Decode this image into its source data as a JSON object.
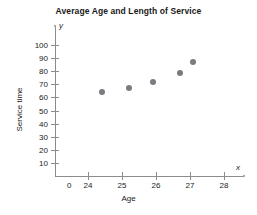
{
  "chart_data": {
    "type": "scatter",
    "title": "Average Age and Length of Service",
    "xlabel": "Age",
    "ylabel": "Service time",
    "xlim": [
      23.5,
      28.5
    ],
    "ylim": [
      0,
      105
    ],
    "grid": false,
    "legend": null,
    "x_axis_symbol": "x",
    "y_axis_symbol": "y",
    "xticks": [
      {
        "label": "0",
        "value": 23.45
      },
      {
        "label": "24",
        "value": 24
      },
      {
        "label": "25",
        "value": 25
      },
      {
        "label": "26",
        "value": 26
      },
      {
        "label": "27",
        "value": 27
      },
      {
        "label": "28",
        "value": 28
      }
    ],
    "yticks": [
      {
        "label": "10",
        "value": 10
      },
      {
        "label": "20",
        "value": 20
      },
      {
        "label": "30",
        "value": 30
      },
      {
        "label": "40",
        "value": 40
      },
      {
        "label": "50",
        "value": 50
      },
      {
        "label": "60",
        "value": 60
      },
      {
        "label": "70",
        "value": 70
      },
      {
        "label": "80",
        "value": 80
      },
      {
        "label": "90",
        "value": 90
      },
      {
        "label": "100",
        "value": 100
      }
    ],
    "points": [
      {
        "x": 24.4,
        "y": 64
      },
      {
        "x": 25.2,
        "y": 67
      },
      {
        "x": 25.9,
        "y": 72
      },
      {
        "x": 26.7,
        "y": 79
      },
      {
        "x": 27.1,
        "y": 87
      }
    ],
    "marker_color": "#7a7a80",
    "axis_color": "#8c8c8c",
    "text_color": "#1a1a1a",
    "background": "#ffffff"
  }
}
